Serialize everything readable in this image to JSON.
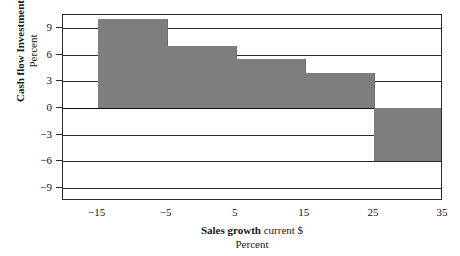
{
  "chart_data": {
    "type": "bar",
    "title": "",
    "top_caption": "",
    "xlabel_main": "Sales growth",
    "xlabel_tail": "current $",
    "xlabel_sub": "Percent",
    "ylabel_main": "Cash flow  Investment",
    "ylabel_sub": "Percent",
    "xlim": [
      -20,
      35
    ],
    "ylim": [
      -10.5,
      10.5
    ],
    "grid": true,
    "legend": "none",
    "xticks": [
      "−15",
      "−5",
      "5",
      "15",
      "25",
      "35"
    ],
    "xtick_values": [
      -15,
      -5,
      5,
      15,
      25,
      35
    ],
    "yticks": [
      "9",
      "6",
      "3",
      "0",
      "−3",
      "−6",
      "−9"
    ],
    "ytick_values": [
      9,
      6,
      3,
      0,
      -3,
      -6,
      -9
    ],
    "bins": [
      {
        "x_start": -15,
        "x_end": -5,
        "value": 10.0
      },
      {
        "x_start": -5,
        "x_end": 5,
        "value": 7.0
      },
      {
        "x_start": 5,
        "x_end": 15,
        "value": 5.5
      },
      {
        "x_start": 15,
        "x_end": 25,
        "value": 4.0
      },
      {
        "x_start": 25,
        "x_end": 35,
        "value": -6.0
      }
    ],
    "categories": [
      "-15 to -5",
      "-5 to 5",
      "5 to 15",
      "15 to 25",
      "25 to 35"
    ],
    "values": [
      10.0,
      7.0,
      5.5,
      4.0,
      -6.0
    ],
    "colors": {
      "bar": "#7e7e7e",
      "axis": "#2b2b2b",
      "background": "#ffffff",
      "text": "#111111"
    }
  }
}
